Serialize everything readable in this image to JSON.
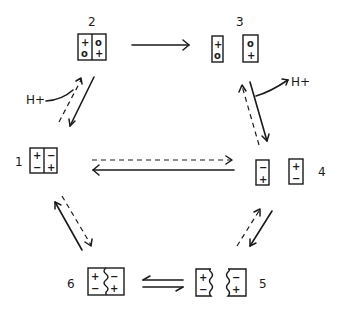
{
  "diagram": {
    "type": "reaction-cycle",
    "states": [
      {
        "id": "1",
        "label": "1",
        "cells": [
          [
            "+",
            "−"
          ],
          [
            "−",
            "+"
          ]
        ],
        "form": "joined box, straight divider"
      },
      {
        "id": "2",
        "label": "2",
        "cells": [
          [
            "+",
            "o"
          ],
          [
            "o",
            "+"
          ]
        ],
        "form": "joined box, straight divider"
      },
      {
        "id": "3",
        "label": "3",
        "cells": [
          [
            "+",
            "o"
          ],
          [
            "o",
            "+"
          ]
        ],
        "form": "two separated boxes"
      },
      {
        "id": "4",
        "label": "4",
        "cells": [
          [
            "−",
            "+"
          ],
          [
            "+",
            "−"
          ]
        ],
        "form": "two separated boxes"
      },
      {
        "id": "5",
        "label": "5",
        "cells": [
          [
            "+",
            "−"
          ],
          [
            "−",
            "+"
          ]
        ],
        "form": "two separated boxes, wavy inner edges"
      },
      {
        "id": "6",
        "label": "6",
        "cells": [
          [
            "+",
            "−"
          ],
          [
            "−",
            "+"
          ]
        ],
        "form": "joined box, wavy divider"
      }
    ],
    "annotations": {
      "proton_in": "H+",
      "proton_out": "H+"
    },
    "transitions": [
      {
        "from": "2",
        "to": "3",
        "style": "solid",
        "note": "single forward arrow"
      },
      {
        "from": "3",
        "to": "4",
        "style": "solid",
        "note": "releases H+"
      },
      {
        "from": "4",
        "to": "3",
        "style": "dashed"
      },
      {
        "from": "4",
        "to": "5",
        "style": "solid"
      },
      {
        "from": "5",
        "to": "4",
        "style": "dashed"
      },
      {
        "from": "5",
        "to": "6",
        "style": "harpoon-equilibrium"
      },
      {
        "from": "6",
        "to": "5",
        "style": "harpoon-equilibrium"
      },
      {
        "from": "6",
        "to": "1",
        "style": "solid"
      },
      {
        "from": "1",
        "to": "6",
        "style": "dashed"
      },
      {
        "from": "4",
        "to": "1",
        "style": "solid"
      },
      {
        "from": "1",
        "to": "4",
        "style": "dashed"
      },
      {
        "from": "2",
        "to": "1",
        "style": "solid"
      },
      {
        "from": "1",
        "to": "2",
        "style": "dashed",
        "note": "takes up H+"
      }
    ]
  }
}
